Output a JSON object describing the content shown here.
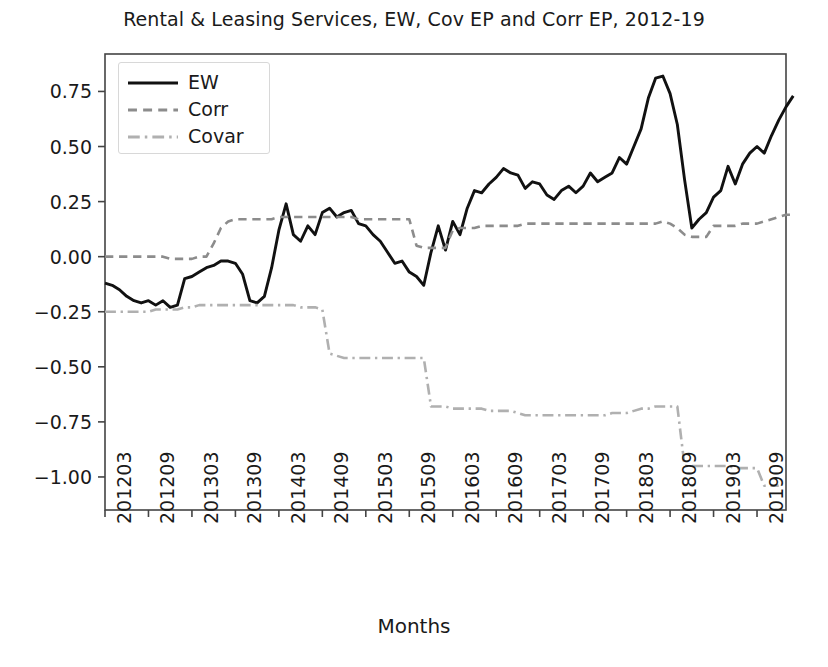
{
  "chart_data": {
    "type": "line",
    "title": "Rental & Leasing Services, EW, Cov EP and Corr EP, 2012-19",
    "xlabel": "Months",
    "ylabel": "",
    "ylim": [
      -1.15,
      0.92
    ],
    "xlim": [
      0,
      94
    ],
    "grid": false,
    "legend_position": "upper left",
    "ytick_labels": [
      "0.75",
      "0.50",
      "0.25",
      "0.00",
      "−0.25",
      "−0.50",
      "−0.75",
      "−1.00"
    ],
    "ytick_values": [
      0.75,
      0.5,
      0.25,
      0.0,
      -0.25,
      -0.5,
      -0.75,
      -1.0
    ],
    "xtick_labels": [
      "201203",
      "201209",
      "201303",
      "201309",
      "201403",
      "201409",
      "201503",
      "201509",
      "201603",
      "201609",
      "201703",
      "201709",
      "201803",
      "201809",
      "201903",
      "201909"
    ],
    "xtick_positions": [
      0,
      6,
      12,
      18,
      24,
      30,
      36,
      42,
      48,
      54,
      60,
      66,
      72,
      78,
      84,
      90
    ],
    "series": [
      {
        "name": "EW",
        "color": "#111111",
        "style": "solid",
        "values": [
          -0.12,
          -0.13,
          -0.15,
          -0.18,
          -0.2,
          -0.21,
          -0.2,
          -0.22,
          -0.2,
          -0.23,
          -0.22,
          -0.1,
          -0.09,
          -0.07,
          -0.05,
          -0.04,
          -0.02,
          -0.02,
          -0.03,
          -0.08,
          -0.2,
          -0.21,
          -0.18,
          -0.05,
          0.12,
          0.24,
          0.1,
          0.07,
          0.14,
          0.1,
          0.2,
          0.22,
          0.18,
          0.2,
          0.21,
          0.15,
          0.14,
          0.1,
          0.07,
          0.02,
          -0.03,
          -0.02,
          -0.07,
          -0.09,
          -0.13,
          0.02,
          0.14,
          0.03,
          0.16,
          0.1,
          0.22,
          0.3,
          0.29,
          0.33,
          0.36,
          0.4,
          0.38,
          0.37,
          0.31,
          0.34,
          0.33,
          0.28,
          0.26,
          0.3,
          0.32,
          0.29,
          0.32,
          0.38,
          0.34,
          0.36,
          0.38,
          0.45,
          0.42,
          0.5,
          0.58,
          0.72,
          0.81,
          0.82,
          0.74,
          0.6,
          0.35,
          0.13,
          0.17,
          0.2,
          0.27,
          0.3,
          0.41,
          0.33,
          0.42,
          0.47,
          0.5,
          0.47,
          0.55,
          0.62,
          0.68,
          0.73
        ]
      },
      {
        "name": "Corr",
        "color": "#8c8c8c",
        "style": "dashed",
        "values": [
          0.0,
          0.0,
          0.0,
          0.0,
          0.0,
          0.0,
          0.0,
          0.0,
          0.0,
          -0.01,
          -0.01,
          -0.01,
          -0.01,
          0.0,
          0.0,
          0.06,
          0.13,
          0.16,
          0.17,
          0.17,
          0.17,
          0.17,
          0.17,
          0.17,
          0.18,
          0.18,
          0.18,
          0.18,
          0.18,
          0.18,
          0.18,
          0.18,
          0.18,
          0.18,
          0.18,
          0.17,
          0.17,
          0.17,
          0.17,
          0.17,
          0.17,
          0.17,
          0.17,
          0.05,
          0.04,
          0.04,
          0.04,
          0.04,
          0.12,
          0.13,
          0.13,
          0.13,
          0.14,
          0.14,
          0.14,
          0.14,
          0.14,
          0.14,
          0.15,
          0.15,
          0.15,
          0.15,
          0.15,
          0.15,
          0.15,
          0.15,
          0.15,
          0.15,
          0.15,
          0.15,
          0.15,
          0.15,
          0.15,
          0.15,
          0.15,
          0.15,
          0.15,
          0.16,
          0.15,
          0.13,
          0.1,
          0.09,
          0.09,
          0.09,
          0.14,
          0.14,
          0.14,
          0.14,
          0.15,
          0.15,
          0.15,
          0.16,
          0.17,
          0.18,
          0.19,
          0.19
        ]
      },
      {
        "name": "Covar",
        "color": "#b0b0b0",
        "style": "dashdot",
        "values": [
          -0.25,
          -0.25,
          -0.25,
          -0.25,
          -0.25,
          -0.25,
          -0.25,
          -0.24,
          -0.24,
          -0.24,
          -0.24,
          -0.23,
          -0.23,
          -0.22,
          -0.22,
          -0.22,
          -0.22,
          -0.22,
          -0.22,
          -0.22,
          -0.22,
          -0.22,
          -0.22,
          -0.22,
          -0.22,
          -0.22,
          -0.22,
          -0.23,
          -0.23,
          -0.23,
          -0.24,
          -0.44,
          -0.45,
          -0.46,
          -0.46,
          -0.46,
          -0.46,
          -0.46,
          -0.46,
          -0.46,
          -0.46,
          -0.46,
          -0.46,
          -0.46,
          -0.46,
          -0.68,
          -0.68,
          -0.68,
          -0.69,
          -0.69,
          -0.69,
          -0.69,
          -0.69,
          -0.7,
          -0.7,
          -0.7,
          -0.7,
          -0.71,
          -0.72,
          -0.72,
          -0.72,
          -0.72,
          -0.72,
          -0.72,
          -0.72,
          -0.72,
          -0.72,
          -0.72,
          -0.72,
          -0.72,
          -0.71,
          -0.71,
          -0.71,
          -0.7,
          -0.69,
          -0.69,
          -0.68,
          -0.68,
          -0.68,
          -0.68,
          -0.95,
          -0.95,
          -0.95,
          -0.95,
          -0.95,
          -0.95,
          -0.95,
          -0.96,
          -0.96,
          -0.96,
          -0.96,
          -1.04,
          -1.04,
          -1.04
        ]
      }
    ]
  }
}
